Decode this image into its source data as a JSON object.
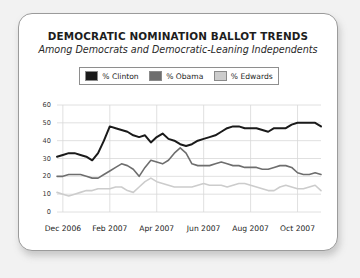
{
  "card": {
    "title": "DEMOCRATIC NOMINATION BALLOT TRENDS",
    "subtitle": "Among Democrats and Democratic-Leaning Independents"
  },
  "legend": {
    "position": "top-center",
    "items": [
      {
        "label": "% Clinton",
        "color": "#1a1a1a",
        "icon": "legend-swatch-icon"
      },
      {
        "label": "% Obama",
        "color": "#6e6e6e",
        "icon": "legend-swatch-icon"
      },
      {
        "label": "% Edwards",
        "color": "#cccccc",
        "icon": "legend-swatch-icon"
      }
    ]
  },
  "chart_data": {
    "type": "line",
    "title": "DEMOCRATIC NOMINATION BALLOT TRENDS",
    "subtitle": "Among Democrats and Democratic-Leaning Independents",
    "xlabel": "",
    "ylabel": "",
    "ylim": [
      0,
      60
    ],
    "yticks": [
      0,
      10,
      20,
      30,
      40,
      50,
      60
    ],
    "ytick_labels": [
      "0",
      "10",
      "20",
      "30",
      "40",
      "50",
      "60"
    ],
    "xtick_labels": [
      "Dec 2006",
      "Feb 2007",
      "Apr 2007",
      "Jun 2007",
      "Aug 2007",
      "Oct 2007"
    ],
    "xtick_positions": [
      1,
      9,
      17,
      25,
      33,
      41
    ],
    "grid": true,
    "grid_axis": "both",
    "x": [
      0,
      1,
      2,
      3,
      4,
      5,
      6,
      7,
      8,
      9,
      10,
      11,
      12,
      13,
      14,
      15,
      16,
      17,
      18,
      19,
      20,
      21,
      22,
      23,
      24,
      25,
      26,
      27,
      28,
      29,
      30,
      31,
      32,
      33,
      34,
      35,
      36,
      37,
      38,
      39,
      40,
      41,
      42,
      43,
      44,
      45
    ],
    "series": [
      {
        "name": "% Clinton",
        "color": "#1a1a1a",
        "values": [
          31,
          32,
          33,
          33,
          32,
          31,
          29,
          33,
          40,
          48,
          47,
          46,
          45,
          43,
          42,
          43,
          39,
          42,
          44,
          41,
          40,
          38,
          37,
          38,
          40,
          41,
          42,
          43,
          45,
          47,
          48,
          48,
          47,
          47,
          47,
          46,
          45,
          47,
          47,
          47,
          49,
          50,
          50,
          50,
          50,
          48
        ]
      },
      {
        "name": "% Obama",
        "color": "#6e6e6e",
        "values": [
          20,
          20,
          21,
          21,
          21,
          20,
          19,
          19,
          21,
          23,
          25,
          27,
          26,
          24,
          20,
          25,
          29,
          28,
          27,
          29,
          33,
          36,
          33,
          27,
          26,
          26,
          26,
          27,
          28,
          27,
          26,
          26,
          25,
          25,
          25,
          24,
          24,
          25,
          26,
          26,
          25,
          22,
          21,
          21,
          22,
          21
        ]
      },
      {
        "name": "% Edwards",
        "color": "#cccccc",
        "values": [
          11,
          10,
          9,
          10,
          11,
          12,
          12,
          13,
          13,
          13,
          14,
          14,
          12,
          11,
          14,
          17,
          19,
          17,
          16,
          15,
          14,
          14,
          14,
          14,
          15,
          16,
          15,
          15,
          15,
          14,
          15,
          16,
          16,
          15,
          14,
          13,
          12,
          12,
          14,
          15,
          14,
          13,
          13,
          14,
          15,
          12
        ]
      }
    ]
  }
}
